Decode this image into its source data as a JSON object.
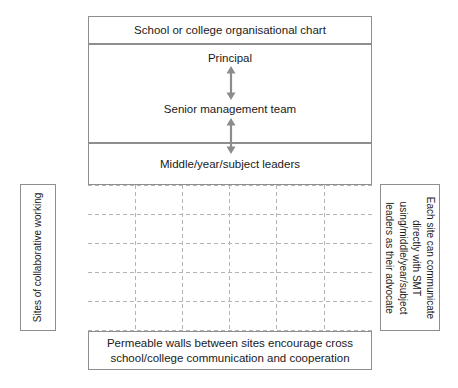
{
  "diagram": {
    "title": "School or college organisational chart",
    "hierarchy": {
      "levels": [
        {
          "id": "principal",
          "label": "Principal"
        },
        {
          "id": "senior-management-team",
          "label": "Senior management team"
        },
        {
          "id": "middle-year-subject-leaders",
          "label": "Middle/year/subject leaders"
        }
      ],
      "connectors": [
        {
          "id": "principal-to-smt",
          "type": "double-headed-arrow"
        },
        {
          "id": "smt-to-leaders",
          "type": "double-headed-arrow"
        }
      ]
    },
    "grid": {
      "label": "dashed sites grid",
      "columns": 6,
      "rows": 5
    },
    "left_panel": {
      "label": "Sites of collaborative working"
    },
    "right_panel": {
      "lines": [
        "Each site can communicate",
        "directly with SMT",
        "using/middle/year/subject",
        "leaders as their advocate"
      ]
    },
    "caption": {
      "lines": [
        "Permeable walls between sites encourage cross",
        "school/college communication and cooperation"
      ]
    },
    "colors": {
      "border": "#8e8e8e",
      "dashed": "#b4b4b4",
      "arrow": "#8c8c8c",
      "text": "#1a1a1a"
    }
  }
}
